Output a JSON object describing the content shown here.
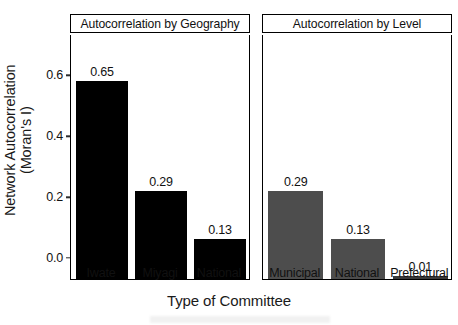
{
  "chart_data": {
    "type": "bar",
    "title": "",
    "xlabel": "Type of Committee",
    "ylabel": "Network Autocorrelation (Moran's I)",
    "ylabel_line1": "Network Autocorrelation",
    "ylabel_line2": "(Moran's I)",
    "ylim": [
      0.0,
      0.7
    ],
    "yticks": [
      0.0,
      0.2,
      0.4,
      0.6
    ],
    "ytick_labels": [
      "0.0",
      "0.2",
      "0.4",
      "0.6"
    ],
    "grid": false,
    "legend": "none",
    "panels": [
      {
        "strip_title": "Autocorrelation by Geography",
        "bar_color": "#000000",
        "categories": [
          "Iwate",
          "Miyagi",
          "National"
        ],
        "values": [
          0.65,
          0.29,
          0.13
        ],
        "value_labels": [
          "0.65",
          "0.29",
          "0.13"
        ]
      },
      {
        "strip_title": "Autocorrelation by Level",
        "bar_color": "#4d4d4d",
        "categories": [
          "Municipal",
          "National",
          "Prefectural"
        ],
        "values": [
          0.29,
          0.13,
          0.01
        ],
        "value_labels": [
          "0.29",
          "0.13",
          "0.01"
        ]
      }
    ]
  }
}
